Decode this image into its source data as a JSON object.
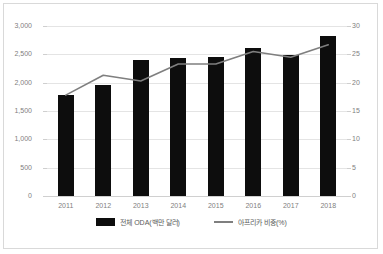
{
  "chart_data": {
    "type": "bar",
    "title": "",
    "subtitle": "",
    "xlabel": "",
    "ylabel": "",
    "categories": [
      "2011",
      "2012",
      "2013",
      "2014",
      "2015",
      "2016",
      "2017",
      "2018"
    ],
    "grid": true,
    "legend_position": "bottom",
    "series": [
      {
        "name": "전체 ODA(백만 달러)",
        "type": "bar",
        "axis": "left",
        "color": "#0d0d0d",
        "values": [
          1780,
          1960,
          2400,
          2430,
          2450,
          2610,
          2490,
          2820
        ]
      },
      {
        "name": "아프리카 비중(%)",
        "type": "line",
        "axis": "right",
        "color": "#7f7f7f",
        "values": [
          17.8,
          21.3,
          20.3,
          23.3,
          23.3,
          25.5,
          24.5,
          26.7
        ]
      }
    ],
    "left_axis": {
      "label": "",
      "ylim": [
        0,
        3000
      ],
      "ticks": [
        0,
        500,
        1000,
        1500,
        2000,
        2500,
        3000
      ],
      "tick_labels": [
        "0",
        "500",
        "1,000",
        "1,500",
        "2,000",
        "2,500",
        "3,000"
      ]
    },
    "right_axis": {
      "label": "",
      "ylim": [
        0,
        30
      ],
      "ticks": [
        0,
        5,
        10,
        15,
        20,
        25,
        30
      ],
      "tick_labels": [
        "0",
        "5",
        "10",
        "15",
        "20",
        "25",
        "30"
      ]
    }
  },
  "legend": {
    "items": [
      {
        "label": "전체 ODA(백만 달러)",
        "marker": "bar-swatch-icon"
      },
      {
        "label": "아프리카 비중(%)",
        "marker": "line-swatch-icon"
      }
    ]
  },
  "colors": {
    "bar": "#0d0d0d",
    "line": "#7f7f7f",
    "grid": "#e4e4e4",
    "frame_border": "#d9d9d9",
    "tick_text": "#808080",
    "legend_text": "#5a5a5a",
    "background": "#ffffff"
  }
}
